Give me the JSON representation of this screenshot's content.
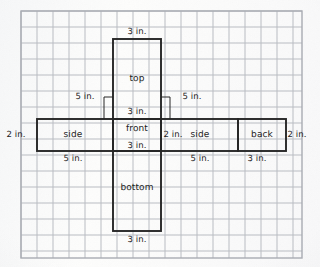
{
  "diagram": {
    "units": "in.",
    "paper": {
      "background_color": "#fbfbfa",
      "grid_line_color": "#b9bcc2",
      "grid_cell_px": 16,
      "net_line_color": "#262626",
      "text_color": "#1c1c1c"
    },
    "frame": {
      "x": 21,
      "y": 11,
      "width": 281,
      "height": 247
    },
    "faces": [
      {
        "name": "top",
        "label": "top",
        "x": 113,
        "y": 39,
        "width": 48,
        "height": 80
      },
      {
        "name": "front",
        "label": "front",
        "x": 113,
        "y": 119,
        "width": 48,
        "height": 32
      },
      {
        "name": "bottom",
        "label": "bottom",
        "x": 113,
        "y": 151,
        "width": 48,
        "height": 80
      },
      {
        "name": "side-left",
        "label": "side",
        "x": 37,
        "y": 119,
        "width": 76,
        "height": 32
      },
      {
        "name": "side-right",
        "label": "side",
        "x": 161,
        "y": 119,
        "width": 77,
        "height": 32
      },
      {
        "name": "back",
        "label": "back",
        "x": 238,
        "y": 119,
        "width": 48,
        "height": 32
      }
    ],
    "dimension_labels": [
      {
        "name": "top-width",
        "text": "3 in.",
        "x": 137,
        "y": 32
      },
      {
        "name": "top-height-left",
        "text": "5 in.",
        "x": 85,
        "y": 97
      },
      {
        "name": "top-height-right",
        "text": "5 in.",
        "x": 192,
        "y": 97
      },
      {
        "name": "front-width-upper",
        "text": "3 in.",
        "x": 137,
        "y": 112
      },
      {
        "name": "front-width-lower",
        "text": "3 in.",
        "x": 137,
        "y": 146
      },
      {
        "name": "side-left-height",
        "text": "2 in.",
        "x": 16,
        "y": 135
      },
      {
        "name": "front-right-height",
        "text": "2 in.",
        "x": 172,
        "y": 135
      },
      {
        "name": "back-right-height",
        "text": "2 in.",
        "x": 297,
        "y": 135
      },
      {
        "name": "side-left-width",
        "text": "5 in.",
        "x": 73,
        "y": 159
      },
      {
        "name": "side-right-width",
        "text": "5 in.",
        "x": 199,
        "y": 159
      },
      {
        "name": "back-width",
        "text": "3 in.",
        "x": 257,
        "y": 159
      },
      {
        "name": "bottom-width",
        "text": "3 in.",
        "x": 137,
        "y": 240
      }
    ],
    "leader_lines": [
      {
        "name": "leader-5in-left",
        "x1": 104,
        "y1": 97,
        "x2": 113,
        "y2": 97
      },
      {
        "name": "tick-5in-left",
        "x1": 104,
        "y1": 97,
        "x2": 104,
        "y2": 119
      },
      {
        "name": "leader-5in-right",
        "x1": 161,
        "y1": 97,
        "x2": 170,
        "y2": 97
      },
      {
        "name": "tick-5in-right",
        "x1": 170,
        "y1": 97,
        "x2": 170,
        "y2": 119
      }
    ]
  }
}
